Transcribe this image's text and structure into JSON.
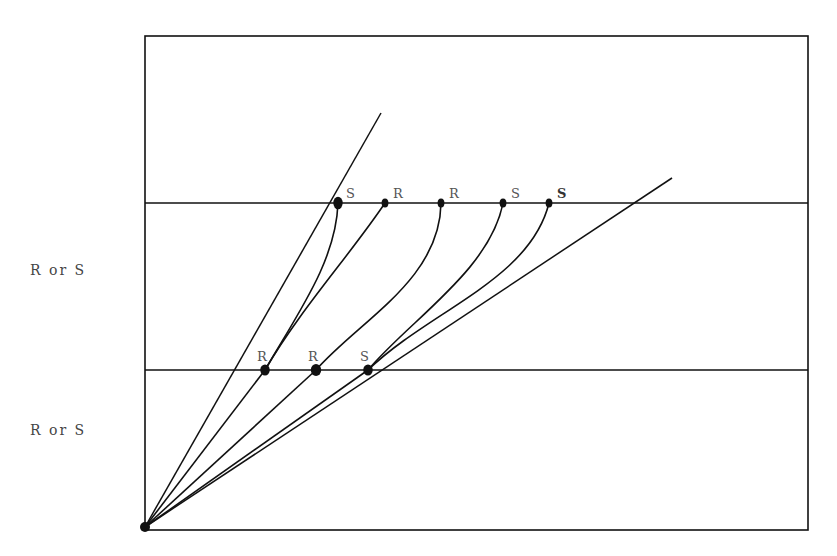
{
  "diagram": {
    "frame": {
      "x1": 145,
      "y1": 36,
      "x2": 808,
      "y2": 530
    },
    "upper_band_line_y": 203,
    "lower_band_line_y": 370,
    "origin": {
      "x": 145,
      "y": 527
    },
    "side_labels": [
      {
        "text": "R or S",
        "x": 30,
        "y": 272
      },
      {
        "text": "R or S",
        "x": 30,
        "y": 432
      }
    ],
    "upper_points": [
      {
        "label": "S",
        "x": 338,
        "y": 203,
        "r": 5.5,
        "bold": false
      },
      {
        "label": "R",
        "x": 385,
        "y": 203,
        "r": 4,
        "bold": false
      },
      {
        "label": "R",
        "x": 441,
        "y": 203,
        "r": 4,
        "bold": false
      },
      {
        "label": "S",
        "x": 503,
        "y": 203,
        "r": 4,
        "bold": false
      },
      {
        "label": "S",
        "x": 549,
        "y": 203,
        "r": 4,
        "bold": true
      }
    ],
    "lower_points": [
      {
        "label": "R",
        "x": 265,
        "y": 370,
        "r": 5
      },
      {
        "label": "R",
        "x": 316,
        "y": 370,
        "r": 5.5
      },
      {
        "label": "S",
        "x": 368,
        "y": 370,
        "r": 5
      }
    ],
    "boundary_lines": [
      {
        "name": "steep-boundary-line",
        "x1": 145,
        "y1": 527,
        "x2": 381,
        "y2": 113
      },
      {
        "name": "shallow-boundary-line",
        "x1": 145,
        "y1": 527,
        "x2": 672,
        "y2": 178
      }
    ],
    "curves": [
      {
        "name": "curve-S1-to-R1",
        "d": "M338,203 C336,260 300,310 265,370"
      },
      {
        "name": "curve-R2-to-R1",
        "d": "M385,203 C350,255 300,310 265,370"
      },
      {
        "name": "curve-R3-to-R2",
        "d": "M441,203 C440,280 360,320 316,370"
      },
      {
        "name": "curve-S4-to-S3",
        "d": "M503,203 C490,270 410,320 368,370"
      },
      {
        "name": "curve-S5-to-S3",
        "d": "M549,203 C530,280 430,310 368,370"
      },
      {
        "name": "lower-curve-R1-to-origin",
        "d": "M265,370 L145,527"
      },
      {
        "name": "lower-curve-R2-to-origin",
        "d": "M316,370 L145,527"
      },
      {
        "name": "lower-curve-S3-to-origin",
        "d": "M368,370 L145,527"
      }
    ],
    "colors": {
      "ink": "#111111",
      "label": "#555555",
      "background": "#ffffff"
    }
  }
}
